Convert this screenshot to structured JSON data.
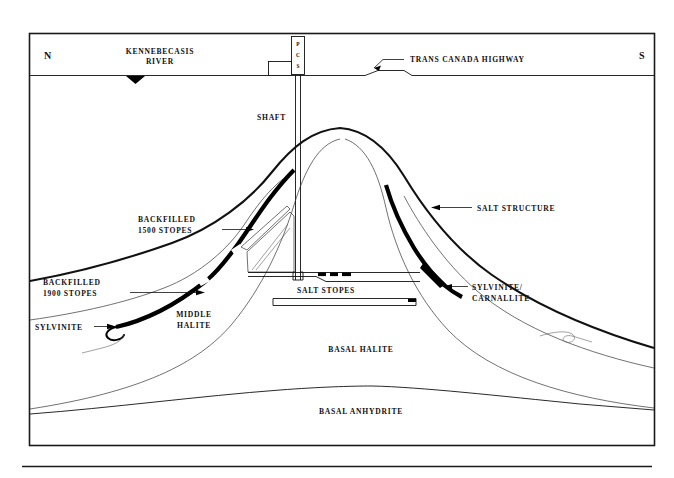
{
  "figure": {
    "title_semantic": "geological-cross-section-salt-dome",
    "orientation_left": "N",
    "orientation_right": "S",
    "background_color": "#ffffff",
    "ink_color": "#111111",
    "ore_color": "#000000"
  },
  "surface": {
    "river_label_line1": "KENNEBECASIS",
    "river_label_line2": "RIVER",
    "highway_label": "TRANS CANADA HIGHWAY",
    "headframe_letters": [
      "P",
      "C",
      "S"
    ]
  },
  "shaft": {
    "label": "SHAFT"
  },
  "annotations": [
    {
      "id": "backfilled-1500",
      "line1": "BACKFILLED",
      "line2": "1500 STOPES"
    },
    {
      "id": "backfilled-1900",
      "line1": "BACKFILLED",
      "line2": "1900 STOPES"
    },
    {
      "id": "sylvinite",
      "line1": "SYLVINITE",
      "line2": ""
    },
    {
      "id": "salt-structure",
      "line1": "SALT STRUCTURE",
      "line2": ""
    },
    {
      "id": "sylvinite-carnallite",
      "line1": "SYLVINITE/",
      "line2": "CARNALLITE"
    },
    {
      "id": "salt-stopes",
      "line1": "SALT STOPES",
      "line2": ""
    }
  ],
  "strata": [
    {
      "id": "middle-halite",
      "line1": "MIDDLE",
      "line2": "HALITE"
    },
    {
      "id": "basal-halite",
      "line1": "BASAL HALITE",
      "line2": ""
    },
    {
      "id": "basal-anhydrite",
      "line1": "BASAL ANHYDRITE",
      "line2": ""
    }
  ]
}
